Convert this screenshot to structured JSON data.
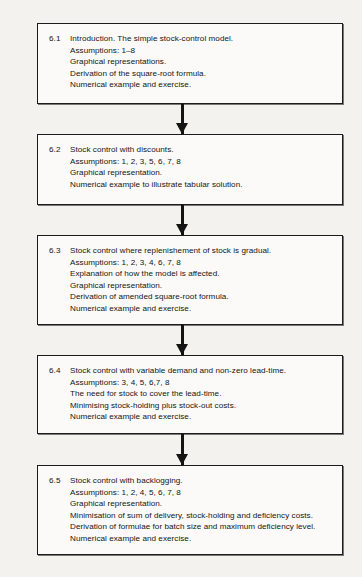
{
  "diagram": {
    "type": "vertical-flowchart",
    "background_color": "#f3f2ef",
    "box_border_color": "#1c1c1c",
    "box_fill_color": "#fbfaf8",
    "text_color": "#141414",
    "arrow_color": "#141414",
    "nodes": [
      {
        "number": "6.1",
        "lines": [
          "Introduction. The simple stock-control model.",
          "Assumptions: 1–8",
          "Graphical representations.",
          "Derivation of the square-root formula.",
          "Numerical example and exercise."
        ]
      },
      {
        "number": "6.2",
        "lines": [
          "Stock control with discounts.",
          "Assumptions:  1, 2, 3, 5, 6, 7, 8",
          "Graphical representation.",
          "Numerical example to illustrate tabular solution."
        ]
      },
      {
        "number": "6.3",
        "lines": [
          "Stock control where replenishement of stock is gradual.",
          "Assumptions:  1, 2, 3, 4, 6, 7, 8",
          "Explanation of how the model is affected.",
          "Graphical representation.",
          "Derivation of amended square-root formula.",
          "Numerical example and exercise."
        ]
      },
      {
        "number": "6.4",
        "lines": [
          "Stock control with variable demand and non-zero lead-time.",
          "Assumptions:  3, 4, 5, 6,7, 8",
          "The need for stock to cover the lead-time.",
          "Minimising stock-holding plus stock-out costs.",
          "Numerical example and exercise."
        ]
      },
      {
        "number": "6.5",
        "lines": [
          "Stock control with backlogging.",
          "Assumptions: 1, 2, 4, 5, 6, 7, 8",
          "Graphical representation.",
          "Minimisation of sum of delivery, stock-holding and deficiency costs.",
          "Derivation of formulae for batch size and maximum deficiency level.",
          "Numerical example and exercise."
        ]
      }
    ],
    "connectors": [
      {
        "from": "6.1",
        "to": "6.2",
        "icon": "arrow-down-icon"
      },
      {
        "from": "6.2",
        "to": "6.3",
        "icon": "arrow-down-icon"
      },
      {
        "from": "6.3",
        "to": "6.4",
        "icon": "arrow-down-icon"
      },
      {
        "from": "6.4",
        "to": "6.5",
        "icon": "arrow-down-icon"
      }
    ]
  }
}
